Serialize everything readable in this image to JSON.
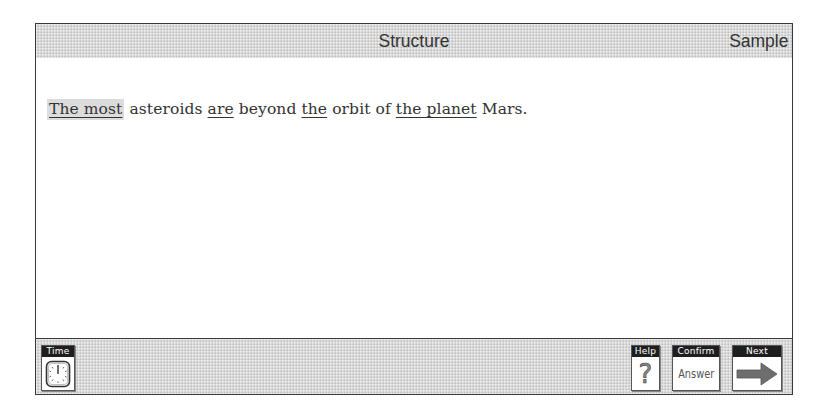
{
  "header": {
    "title": "Structure",
    "section_label": "Sample"
  },
  "question": {
    "segments": [
      {
        "text": "The most",
        "underlined": true,
        "selected": true
      },
      {
        "text": " asteroids ",
        "underlined": false,
        "selected": false
      },
      {
        "text": "are",
        "underlined": true,
        "selected": false
      },
      {
        "text": " beyond ",
        "underlined": false,
        "selected": false
      },
      {
        "text": "the",
        "underlined": true,
        "selected": false
      },
      {
        "text": " orbit of ",
        "underlined": false,
        "selected": false
      },
      {
        "text": "the planet",
        "underlined": true,
        "selected": false
      },
      {
        "text": " Mars.",
        "underlined": false,
        "selected": false
      }
    ]
  },
  "footer": {
    "time": {
      "label": "Time",
      "icon": "clock-icon"
    },
    "help": {
      "label": "Help",
      "icon": "question-mark-icon",
      "glyph": "?"
    },
    "confirm": {
      "label": "Confirm",
      "body": "Answer"
    },
    "next": {
      "label": "Next",
      "icon": "arrow-right-icon"
    }
  },
  "colors": {
    "bar_gray": "#d9d9d9",
    "border": "#3a3a3a",
    "label_bg": "#1e1e1e",
    "selection": "#dcdcdc"
  }
}
